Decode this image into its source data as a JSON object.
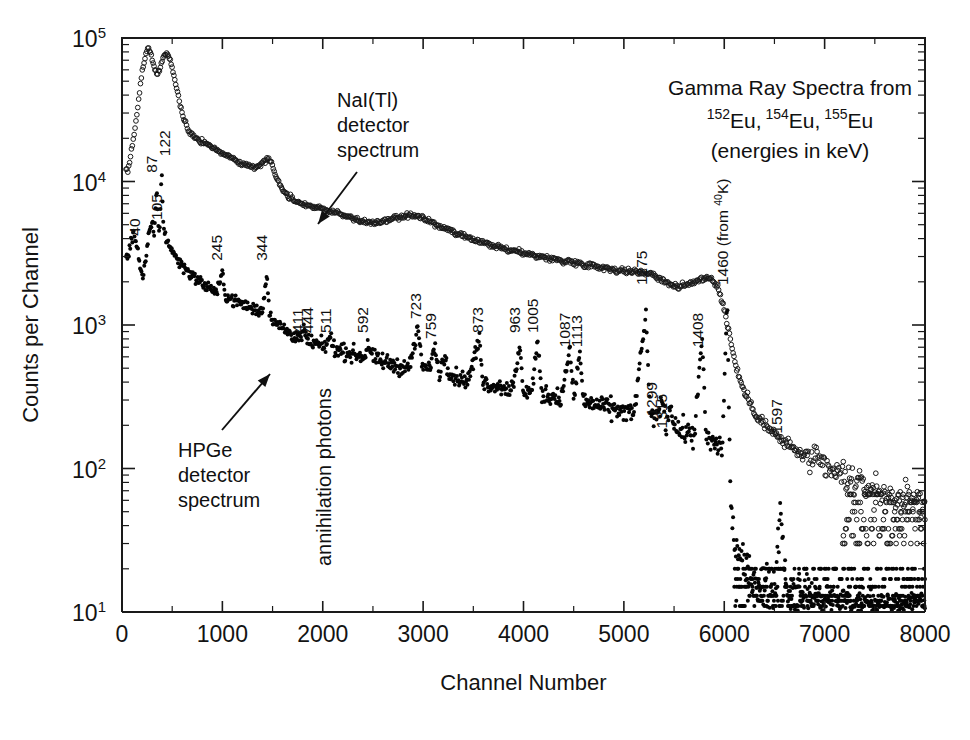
{
  "figure": {
    "width": 970,
    "height": 740,
    "background": "#ffffff",
    "ink_color": "#111111"
  },
  "chart_data": {
    "type": "scatter",
    "title": "",
    "xlabel": "Channel Number",
    "ylabel": "Counts per Channel",
    "xlim": [
      0,
      8000
    ],
    "ylim": [
      10,
      100000
    ],
    "yscale": "log",
    "xscale": "linear",
    "grid": false,
    "legend_position": "none",
    "xticks": [
      0,
      1000,
      2000,
      3000,
      4000,
      5000,
      6000,
      7000,
      8000
    ],
    "xticklabels": [
      "0",
      "1000",
      "2000",
      "3000",
      "4000",
      "5000",
      "6000",
      "7000",
      "8000"
    ],
    "yticks": [
      10,
      100,
      1000,
      10000,
      100000
    ],
    "yticklabels": [
      "10 1",
      "10 2",
      "10 3",
      "10 4",
      "10 5"
    ],
    "ytick_mantissa": "10",
    "ytick_exponents": [
      "1",
      "2",
      "3",
      "4",
      "5"
    ],
    "series": [
      {
        "name": "NaI(Tl) detector spectrum",
        "marker": "open-circle",
        "color": "#1a1a1a",
        "points": [
          [
            60,
            12000
          ],
          [
            80,
            14500
          ],
          [
            110,
            19000
          ],
          [
            150,
            30000
          ],
          [
            190,
            52000
          ],
          [
            230,
            74000
          ],
          [
            260,
            85000
          ],
          [
            290,
            78000
          ],
          [
            320,
            62000
          ],
          [
            350,
            56000
          ],
          [
            380,
            62000
          ],
          [
            410,
            72000
          ],
          [
            440,
            78000
          ],
          [
            470,
            74000
          ],
          [
            500,
            62000
          ],
          [
            540,
            46000
          ],
          [
            580,
            34000
          ],
          [
            620,
            27000
          ],
          [
            660,
            23000
          ],
          [
            700,
            21000
          ],
          [
            760,
            19500
          ],
          [
            820,
            18500
          ],
          [
            880,
            17500
          ],
          [
            950,
            16500
          ],
          [
            1020,
            15500
          ],
          [
            1100,
            14500
          ],
          [
            1180,
            13500
          ],
          [
            1260,
            12800
          ],
          [
            1330,
            12600
          ],
          [
            1390,
            13200
          ],
          [
            1430,
            14200
          ],
          [
            1460,
            14600
          ],
          [
            1480,
            14000
          ],
          [
            1520,
            11500
          ],
          [
            1580,
            9200
          ],
          [
            1650,
            8000
          ],
          [
            1720,
            7400
          ],
          [
            1800,
            7000
          ],
          [
            1900,
            6700
          ],
          [
            2000,
            6400
          ],
          [
            2120,
            6100
          ],
          [
            2250,
            5700
          ],
          [
            2380,
            5300
          ],
          [
            2500,
            5100
          ],
          [
            2620,
            5300
          ],
          [
            2740,
            5600
          ],
          [
            2860,
            5800
          ],
          [
            2960,
            5700
          ],
          [
            3060,
            5300
          ],
          [
            3180,
            4800
          ],
          [
            3300,
            4400
          ],
          [
            3420,
            4100
          ],
          [
            3560,
            3800
          ],
          [
            3700,
            3550
          ],
          [
            3840,
            3350
          ],
          [
            3980,
            3200
          ],
          [
            4120,
            3050
          ],
          [
            4260,
            2900
          ],
          [
            4400,
            2800
          ],
          [
            4540,
            2700
          ],
          [
            4680,
            2600
          ],
          [
            4820,
            2500
          ],
          [
            4960,
            2400
          ],
          [
            5080,
            2350
          ],
          [
            5180,
            2330
          ],
          [
            5260,
            2300
          ],
          [
            5340,
            2150
          ],
          [
            5440,
            1950
          ],
          [
            5540,
            1850
          ],
          [
            5640,
            1900
          ],
          [
            5740,
            2050
          ],
          [
            5820,
            2150
          ],
          [
            5880,
            2100
          ],
          [
            5940,
            1800
          ],
          [
            6000,
            1300
          ],
          [
            6060,
            800
          ],
          [
            6120,
            500
          ],
          [
            6200,
            340
          ],
          [
            6300,
            250
          ],
          [
            6420,
            195
          ],
          [
            6560,
            160
          ],
          [
            6700,
            135
          ],
          [
            6860,
            115
          ],
          [
            7020,
            100
          ],
          [
            7180,
            88
          ],
          [
            7340,
            78
          ],
          [
            7500,
            70
          ],
          [
            7660,
            64
          ],
          [
            7820,
            60
          ],
          [
            7960,
            58
          ]
        ]
      },
      {
        "name": "HPGe detector spectrum",
        "marker": "filled-dot",
        "color": "#050505",
        "points": [
          [
            60,
            3000
          ],
          [
            90,
            3900
          ],
          [
            120,
            4200
          ],
          [
            150,
            3600
          ],
          [
            180,
            2600
          ],
          [
            210,
            2150
          ],
          [
            240,
            3000
          ],
          [
            270,
            4400
          ],
          [
            300,
            5000
          ],
          [
            320,
            4200
          ],
          [
            345,
            9000
          ],
          [
            360,
            5000
          ],
          [
            375,
            4600
          ],
          [
            395,
            12000
          ],
          [
            410,
            5200
          ],
          [
            430,
            4200
          ],
          [
            470,
            3600
          ],
          [
            520,
            3100
          ],
          [
            580,
            2700
          ],
          [
            650,
            2400
          ],
          [
            720,
            2150
          ],
          [
            800,
            1950
          ],
          [
            880,
            1800
          ],
          [
            950,
            1700
          ],
          [
            1000,
            2300
          ],
          [
            1030,
            1600
          ],
          [
            1100,
            1500
          ],
          [
            1200,
            1400
          ],
          [
            1300,
            1300
          ],
          [
            1400,
            1250
          ],
          [
            1440,
            2300
          ],
          [
            1470,
            1200
          ],
          [
            1550,
            1000
          ],
          [
            1650,
            900
          ],
          [
            1720,
            840
          ],
          [
            1790,
            800
          ],
          [
            1810,
            920
          ],
          [
            1860,
            760
          ],
          [
            1940,
            730
          ],
          [
            2020,
            700
          ],
          [
            2070,
            820
          ],
          [
            2120,
            680
          ],
          [
            2220,
            650
          ],
          [
            2330,
            620
          ],
          [
            2420,
            600
          ],
          [
            2450,
            760
          ],
          [
            2500,
            580
          ],
          [
            2620,
            550
          ],
          [
            2740,
            520
          ],
          [
            2860,
            500
          ],
          [
            2950,
            940
          ],
          [
            2990,
            520
          ],
          [
            3050,
            480
          ],
          [
            3120,
            700
          ],
          [
            3160,
            460
          ],
          [
            3220,
            620
          ],
          [
            3270,
            450
          ],
          [
            3350,
            430
          ],
          [
            3450,
            410
          ],
          [
            3560,
            800
          ],
          [
            3600,
            400
          ],
          [
            3700,
            380
          ],
          [
            3800,
            370
          ],
          [
            3900,
            360
          ],
          [
            3960,
            700
          ],
          [
            4000,
            350
          ],
          [
            4080,
            340
          ],
          [
            4140,
            760
          ],
          [
            4180,
            330
          ],
          [
            4280,
            320
          ],
          [
            4380,
            310
          ],
          [
            4460,
            690
          ],
          [
            4500,
            300
          ],
          [
            4560,
            640
          ],
          [
            4600,
            290
          ],
          [
            4700,
            280
          ],
          [
            4800,
            270
          ],
          [
            4900,
            260
          ],
          [
            5000,
            250
          ],
          [
            5100,
            240
          ],
          [
            5220,
            1200
          ],
          [
            5260,
            230
          ],
          [
            5320,
            220
          ],
          [
            5380,
            310
          ],
          [
            5420,
            200
          ],
          [
            5460,
            280
          ],
          [
            5520,
            190
          ],
          [
            5600,
            180
          ],
          [
            5700,
            170
          ],
          [
            5780,
            800
          ],
          [
            5820,
            160
          ],
          [
            5900,
            150
          ],
          [
            5980,
            140
          ],
          [
            6030,
            1500
          ],
          [
            6060,
            70
          ],
          [
            6100,
            30
          ],
          [
            6200,
            20
          ],
          [
            6350,
            16
          ],
          [
            6500,
            14
          ],
          [
            6560,
            55
          ],
          [
            6620,
            14
          ],
          [
            6800,
            13
          ],
          [
            7000,
            12
          ],
          [
            7200,
            12
          ],
          [
            7400,
            11
          ],
          [
            7600,
            11
          ],
          [
            7800,
            11
          ],
          [
            7960,
            11
          ]
        ]
      }
    ],
    "peak_labels": [
      {
        "text": "40",
        "channel": 175,
        "value": 4200
      },
      {
        "text": "87",
        "channel": 345,
        "value": 11500
      },
      {
        "text": "105",
        "channel": 400,
        "value": 5400
      },
      {
        "text": "122",
        "channel": 478,
        "value": 15000
      },
      {
        "text": "245",
        "channel": 1000,
        "value": 2800
      },
      {
        "text": "344",
        "channel": 1440,
        "value": 2800
      },
      {
        "text": "411",
        "channel": 1800,
        "value": 880
      },
      {
        "text": "444",
        "channel": 1905,
        "value": 880
      },
      {
        "text": "511",
        "channel": 2085,
        "value": 880
      },
      {
        "text": "592",
        "channel": 2450,
        "value": 880
      },
      {
        "text": "723",
        "channel": 2975,
        "value": 1100
      },
      {
        "text": "759",
        "channel": 3130,
        "value": 800
      },
      {
        "text": "873",
        "channel": 3595,
        "value": 880
      },
      {
        "text": "963",
        "channel": 3965,
        "value": 880
      },
      {
        "text": "1005",
        "channel": 4140,
        "value": 880
      },
      {
        "text": "1087",
        "channel": 4465,
        "value": 700
      },
      {
        "text": "1113",
        "channel": 4580,
        "value": 700
      },
      {
        "text": "1275",
        "channel": 5230,
        "value": 1900
      },
      {
        "text": "1299",
        "channel": 5330,
        "value": 230
      },
      {
        "text": "1315",
        "channel": 5430,
        "value": 190
      },
      {
        "text": "1408",
        "channel": 5790,
        "value": 700
      },
      {
        "text": "1597",
        "channel": 6570,
        "value": 175
      }
    ],
    "peak_labels_rich": [
      {
        "prefix": "1460 (from ",
        "sup": "40",
        "suffix": "K)",
        "channel": 6040,
        "value": 1900
      }
    ],
    "annotations": [
      {
        "name": "nai-annotation",
        "lines": [
          "NaI(Tl)",
          "detector",
          "spectrum"
        ],
        "text_x": 337,
        "text_y": 107,
        "arrow": {
          "x1": 357,
          "y1": 172,
          "x2": 318,
          "y2": 224
        }
      },
      {
        "name": "hpge-annotation",
        "lines": [
          "HPGe",
          "detector",
          "spectrum"
        ],
        "text_x": 178,
        "text_y": 457,
        "arrow": {
          "x1": 222,
          "y1": 430,
          "x2": 270,
          "y2": 374
        }
      },
      {
        "name": "annihilation-annotation",
        "lines": [
          "annihilation photons"
        ],
        "rotated": true,
        "channel": 2085,
        "text_y": 566
      }
    ],
    "corner_note": {
      "line1": "Gamma Ray Spectra from",
      "line2_parts": [
        {
          "sup": "152",
          "base": "Eu,"
        },
        {
          "sup": "154",
          "base": "Eu,"
        },
        {
          "sup": "155",
          "base": "Eu"
        }
      ],
      "line3": "(energies in keV)"
    }
  }
}
